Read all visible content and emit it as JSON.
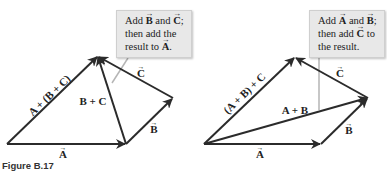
{
  "figure": {
    "caption": "Figure B.17"
  },
  "left_diagram": {
    "description": "A + (B + C) construction",
    "callout": {
      "line1_pre": "Add ",
      "line1_vec1": "B",
      "line1_mid": " and ",
      "line1_vec2": "C",
      "line1_post": ";",
      "line2": "then add the",
      "line3_pre": "result to ",
      "line3_vec": "A",
      "line3_post": "."
    },
    "vectors": [
      {
        "name": "A",
        "label": "A",
        "from": [
          7,
          144
        ],
        "to": [
          126,
          144
        ]
      },
      {
        "name": "B",
        "label": "B",
        "from": [
          126,
          144
        ],
        "to": [
          173,
          98
        ]
      },
      {
        "name": "C",
        "label": "C",
        "from": [
          173,
          98
        ],
        "to": [
          98,
          56
        ]
      },
      {
        "name": "B+C",
        "label": "B + C",
        "from": [
          126,
          144
        ],
        "to": [
          98,
          56
        ]
      },
      {
        "name": "A+(B+C)",
        "label": "A + (B + C)",
        "from": [
          7,
          144
        ],
        "to": [
          98,
          56
        ]
      }
    ],
    "labels": {
      "A": "A",
      "B": "B",
      "C": "C",
      "B_plus_C": "B + C",
      "resultant": "A + (B + C)"
    }
  },
  "right_diagram": {
    "description": "(A + B) + C construction",
    "callout": {
      "line1_pre": "Add ",
      "line1_vec1": "A",
      "line1_mid": " and ",
      "line1_vec2": "B",
      "line1_post": ";",
      "line2_pre": "then add ",
      "line2_vec": "C",
      "line2_post": " to",
      "line3": "the result."
    },
    "vectors": [
      {
        "name": "A",
        "label": "A",
        "from": [
          204,
          144
        ],
        "to": [
          321,
          144
        ]
      },
      {
        "name": "B",
        "label": "B",
        "from": [
          321,
          144
        ],
        "to": [
          368,
          98
        ]
      },
      {
        "name": "A+B",
        "label": "A + B",
        "from": [
          204,
          144
        ],
        "to": [
          368,
          98
        ]
      },
      {
        "name": "C",
        "label": "C",
        "from": [
          368,
          98
        ],
        "to": [
          295,
          57
        ]
      },
      {
        "name": "(A+B)+C",
        "label": "(A + B) + C",
        "from": [
          204,
          144
        ],
        "to": [
          295,
          57
        ]
      }
    ],
    "labels": {
      "A": "A",
      "B": "B",
      "C": "C",
      "A_plus_B": "A + B",
      "resultant": "(A + B) + C"
    }
  },
  "colors": {
    "vector": "#2b2b2b",
    "callout_bg": "#e8e8e8",
    "callout_pointer": "#b5b5b5",
    "text": "#222222"
  }
}
